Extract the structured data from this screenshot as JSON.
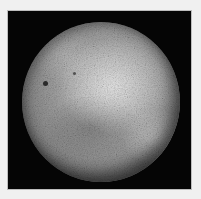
{
  "image": {
    "subject": "planetary body",
    "description": "Grayscale cratered sphere on black background",
    "colors": {
      "border": "#f0f0f0",
      "background": "#050505",
      "surface_light": "#d8d8d8",
      "surface_mid": "#9a9a9a",
      "surface_dark": "#3a3a3a"
    },
    "features": [
      {
        "name": "dark-spot-1",
        "x": 43,
        "y": 71
      },
      {
        "name": "dark-spot-2",
        "x": 73,
        "y": 62
      }
    ]
  }
}
